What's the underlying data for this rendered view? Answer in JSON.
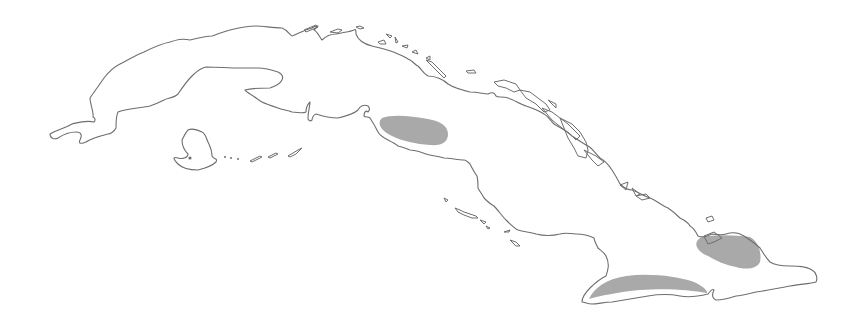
{
  "map": {
    "subject": "Cuba",
    "colors": {
      "background": "#ffffff",
      "coastline": "#6e6e6e",
      "shaded_region": "#a9a9a9"
    },
    "shaded_regions": [
      {
        "id": "central",
        "approx_bbox": [
          378,
          115,
          448,
          145
        ]
      },
      {
        "id": "east",
        "approx_bbox": [
          693,
          235,
          760,
          270
        ]
      },
      {
        "id": "south-east",
        "approx_bbox": [
          588,
          274,
          708,
          300
        ]
      }
    ],
    "labels": []
  }
}
